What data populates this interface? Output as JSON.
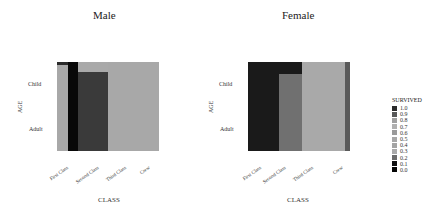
{
  "chart_data": [
    {
      "type": "heatmap",
      "title": "Male",
      "xlabel": "CLASS",
      "ylabel": "AGE",
      "categories_x": [
        "First Class",
        "Second Class",
        "Third Class",
        "Crew"
      ],
      "categories_y": [
        "Child",
        "Adult"
      ],
      "description": "Mosaic plot: column widths proportional to class counts, row heights to age counts; fill = survival rate",
      "cells": [
        {
          "class": "First Class",
          "age": "Child",
          "survived": 1.0
        },
        {
          "class": "First Class",
          "age": "Adult",
          "survived": 0.3
        },
        {
          "class": "Second Class",
          "age": "Child",
          "survived": 1.0
        },
        {
          "class": "Second Class",
          "age": "Adult",
          "survived": 0.1
        },
        {
          "class": "Third Class",
          "age": "Child",
          "survived": 0.3
        },
        {
          "class": "Third Class",
          "age": "Adult",
          "survived": 0.2
        },
        {
          "class": "Crew",
          "age": "Child",
          "survived": null
        },
        {
          "class": "Crew",
          "age": "Adult",
          "survived": 0.2
        }
      ]
    },
    {
      "type": "heatmap",
      "title": "Female",
      "xlabel": "CLASS",
      "ylabel": "AGE",
      "categories_x": [
        "First Class",
        "Second Class",
        "Third Class",
        "Crew"
      ],
      "categories_y": [
        "Child",
        "Adult"
      ],
      "cells": [
        {
          "class": "First Class",
          "age": "Child",
          "survived": 1.0
        },
        {
          "class": "First Class",
          "age": "Adult",
          "survived": 1.0
        },
        {
          "class": "Second Class",
          "age": "Child",
          "survived": 1.0
        },
        {
          "class": "Second Class",
          "age": "Adult",
          "survived": 0.9
        },
        {
          "class": "Third Class",
          "age": "Child",
          "survived": 0.5
        },
        {
          "class": "Third Class",
          "age": "Adult",
          "survived": 0.5
        },
        {
          "class": "Crew",
          "age": "Child",
          "survived": null
        },
        {
          "class": "Crew",
          "age": "Adult",
          "survived": 0.9
        }
      ]
    }
  ],
  "legend": {
    "title": "SURVIVED",
    "items": [
      {
        "label": "1.0",
        "color": "#2b2b2b"
      },
      {
        "label": "0.9",
        "color": "#585858"
      },
      {
        "label": "0.8",
        "color": "#a0a0a0"
      },
      {
        "label": "0.7",
        "color": "#b0b0b0"
      },
      {
        "label": "0.6",
        "color": "#9a9a9a"
      },
      {
        "label": "0.5",
        "color": "#a8a8a8"
      },
      {
        "label": "0.4",
        "color": "#a4a4a4"
      },
      {
        "label": "0.3",
        "color": "#aaaaaa"
      },
      {
        "label": "0.2",
        "color": "#6c6c6c"
      },
      {
        "label": "0.1",
        "color": "#101010"
      },
      {
        "label": "0.0",
        "color": "#050505"
      }
    ]
  },
  "panels": {
    "male": {
      "title": "Male",
      "y_labels": [
        "Child",
        "Adult"
      ],
      "y_title": "AGE",
      "x_ticks": [
        "First Class",
        "Second Class",
        "Third Class",
        "Crew"
      ],
      "x_title": "CLASS",
      "tiles": [
        {
          "x": 57,
          "y": 62,
          "w": 11,
          "h": 3,
          "color": "#2b2b2b"
        },
        {
          "x": 57,
          "y": 65,
          "w": 11,
          "h": 86,
          "color": "#a8a8a8"
        },
        {
          "x": 68,
          "y": 62,
          "w": 10,
          "h": 89,
          "color": "#080808"
        },
        {
          "x": 78,
          "y": 62,
          "w": 30,
          "h": 10,
          "color": "#a9a9a9"
        },
        {
          "x": 78,
          "y": 72,
          "w": 30,
          "h": 79,
          "color": "#3a3a3a"
        },
        {
          "x": 108,
          "y": 62,
          "w": 51,
          "h": 89,
          "color": "#a8a8a8"
        }
      ]
    },
    "female": {
      "title": "Female",
      "y_labels": [
        "Child",
        "Adult"
      ],
      "y_title": "AGE",
      "x_ticks": [
        "First Class",
        "Second Class",
        "Third Class",
        "Crew"
      ],
      "x_title": "CLASS",
      "tiles": [
        {
          "x": 248,
          "y": 62,
          "w": 31,
          "h": 89,
          "color": "#1a1a1a"
        },
        {
          "x": 279,
          "y": 62,
          "w": 23,
          "h": 12,
          "color": "#1a1a1a"
        },
        {
          "x": 279,
          "y": 74,
          "w": 23,
          "h": 77,
          "color": "#707070"
        },
        {
          "x": 302,
          "y": 62,
          "w": 43,
          "h": 89,
          "color": "#a9a9a9"
        },
        {
          "x": 345,
          "y": 62,
          "w": 5,
          "h": 89,
          "color": "#5a5a5a"
        }
      ]
    }
  }
}
